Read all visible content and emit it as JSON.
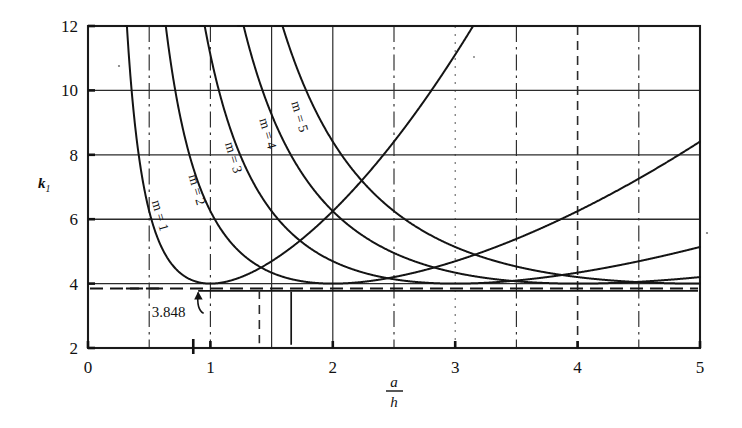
{
  "figure": {
    "kind": "engineering-plot",
    "caption_visible": false
  },
  "chart_data": {
    "type": "line",
    "title": "",
    "subtitle": "",
    "xlabel_numerator": "a",
    "xlabel_denominator": "h",
    "xlabel": "a/h",
    "ylabel": "k",
    "ylabel_subscript": "1",
    "xlim": [
      0,
      5
    ],
    "ylim": [
      2,
      12
    ],
    "xticks": [
      0,
      1,
      2,
      3,
      4,
      5
    ],
    "xtick_labels": [
      "0",
      "1",
      "2",
      "3",
      "4",
      "5"
    ],
    "yticks": [
      2,
      4,
      6,
      8,
      10,
      12
    ],
    "ytick_labels": [
      "2",
      "4",
      "6",
      "8",
      "10",
      "12"
    ],
    "grid": "major horizontal solid, vertical at 0.5 intervals (mixed solid / dash-dot / dotted)",
    "vertical_gridlines": [
      {
        "x": 0.5,
        "style": "dashdot"
      },
      {
        "x": 1.0,
        "style": "dashdot"
      },
      {
        "x": 1.5,
        "style": "solid"
      },
      {
        "x": 2.0,
        "style": "solid"
      },
      {
        "x": 2.5,
        "style": "dashdot"
      },
      {
        "x": 3.0,
        "style": "dotted"
      },
      {
        "x": 3.5,
        "style": "dashdot"
      },
      {
        "x": 4.0,
        "style": "dash"
      },
      {
        "x": 4.5,
        "style": "dashdot"
      }
    ],
    "horizontal_gridlines": [
      4,
      6,
      8,
      10
    ],
    "legend": "inline curve labels",
    "legend_position": "inline",
    "formula_note": "k = (m h / a + a / (m h))^2",
    "series": [
      {
        "name": "m = 1",
        "m": 1,
        "label": "m = 1",
        "label_x": 0.52,
        "label_y": 6.55,
        "minimum_x": 1,
        "minimum_y": 4
      },
      {
        "name": "m = 2",
        "m": 2,
        "label": "m = 2",
        "label_x": 0.82,
        "label_y": 7.35,
        "minimum_x": 2,
        "minimum_y": 4
      },
      {
        "name": "m = 3",
        "m": 3,
        "label": "m = 3",
        "label_x": 1.12,
        "label_y": 8.35,
        "minimum_x": 3,
        "minimum_y": 4
      },
      {
        "name": "m = 4",
        "m": 4,
        "label": "m = 4",
        "label_x": 1.4,
        "label_y": 9.1,
        "minimum_x": 4,
        "minimum_y": 4
      },
      {
        "name": "m = 5",
        "m": 5,
        "label": "m = 5",
        "label_x": 1.66,
        "label_y": 9.62,
        "minimum_x": 5,
        "minimum_y": 4
      }
    ],
    "annotations": [
      {
        "text": "3.848",
        "value": 3.848,
        "kind": "horizontal-reference-line-callout",
        "text_x": 0.52,
        "text_y": 2.95,
        "points_to_x": 0.9,
        "points_to_y": 3.848
      }
    ],
    "reference_lines": [
      {
        "orientation": "horizontal",
        "value": 3.848,
        "style": "dashed",
        "label": "3.848"
      }
    ],
    "curve_intersections": [
      {
        "x": 1.414,
        "y": 4.5,
        "between": [
          "m = 1",
          "m = 2"
        ]
      },
      {
        "x": 2.449,
        "y": 4.333,
        "between": [
          "m = 2",
          "m = 3"
        ]
      },
      {
        "x": 3.464,
        "y": 4.25,
        "between": [
          "m = 3",
          "m = 4"
        ]
      },
      {
        "x": 4.472,
        "y": 4.2,
        "between": [
          "m = 4",
          "m = 5"
        ]
      }
    ]
  }
}
